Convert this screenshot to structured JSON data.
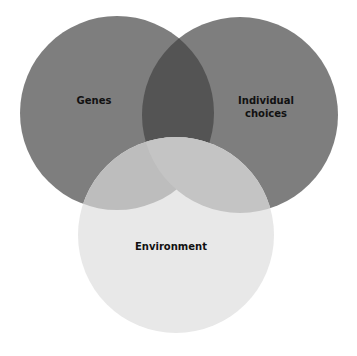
{
  "diagram": {
    "type": "venn",
    "sets": [
      {
        "id": "genes",
        "label": "Genes",
        "cx": 117,
        "cy": 113,
        "r": 97,
        "color": "#7e7e7e"
      },
      {
        "id": "choices",
        "label_line1": "Individual",
        "label_line2": "choices",
        "cx": 240,
        "cy": 115,
        "r": 98,
        "color": "#7e7e7e"
      },
      {
        "id": "environment",
        "label": "Environment",
        "cx": 176,
        "cy": 235,
        "r": 98,
        "color": "#e8e8e8"
      }
    ],
    "overlap_colors": {
      "genes_choices": "#545454",
      "with_environment": "#bdbdbd"
    }
  }
}
